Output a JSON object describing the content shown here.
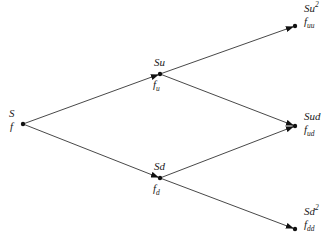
{
  "diagram": {
    "type": "binomial-tree",
    "nodes": [
      {
        "id": "S",
        "price": {
          "base": "S",
          "sup": ""
        },
        "value": {
          "base": "f",
          "sub": ""
        }
      },
      {
        "id": "Su",
        "price": {
          "base": "Su",
          "sup": ""
        },
        "value": {
          "base": "f",
          "sub": "u"
        }
      },
      {
        "id": "Sd",
        "price": {
          "base": "Sd",
          "sup": ""
        },
        "value": {
          "base": "f",
          "sub": "d"
        }
      },
      {
        "id": "Suu",
        "price": {
          "base": "Su",
          "sup": "2"
        },
        "value": {
          "base": "f",
          "sub": "uu"
        }
      },
      {
        "id": "Sud",
        "price": {
          "base": "Sud",
          "sup": ""
        },
        "value": {
          "base": "f",
          "sub": "ud"
        }
      },
      {
        "id": "Sdd",
        "price": {
          "base": "Sd",
          "sup": "2"
        },
        "value": {
          "base": "f",
          "sub": "dd"
        }
      }
    ],
    "edges": [
      {
        "from": "S",
        "to": "Su"
      },
      {
        "from": "S",
        "to": "Sd"
      },
      {
        "from": "Su",
        "to": "Suu"
      },
      {
        "from": "Su",
        "to": "Sud"
      },
      {
        "from": "Sd",
        "to": "Sud"
      },
      {
        "from": "Sd",
        "to": "Sdd"
      }
    ]
  }
}
